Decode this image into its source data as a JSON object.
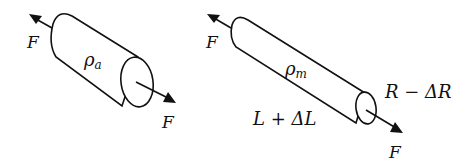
{
  "figure": {
    "panels": [
      {
        "id": "before",
        "resistivity_label": "ρ",
        "resistivity_sub": "a",
        "force_label_left": "F",
        "force_label_right": "F"
      },
      {
        "id": "after",
        "resistivity_label": "ρ",
        "resistivity_sub": "m",
        "force_label_left": "F",
        "force_label_right": "F",
        "length_label": "L + ΔL",
        "radius_label": "R − ΔR"
      }
    ],
    "colors": {
      "stroke": "#111111",
      "background": "#ffffff"
    }
  }
}
